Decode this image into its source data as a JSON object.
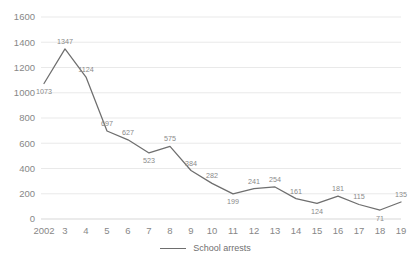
{
  "chart_data": {
    "type": "line",
    "title": "",
    "subtitle": "",
    "xlabel": "",
    "ylabel": "",
    "categories": [
      "2002",
      "3",
      "4",
      "5",
      "6",
      "7",
      "8",
      "9",
      "10",
      "11",
      "12",
      "13",
      "14",
      "15",
      "16",
      "17",
      "18",
      "19"
    ],
    "series": [
      {
        "name": "School arrests",
        "color": "#6e6e6e",
        "values": [
          1073,
          1347,
          1124,
          697,
          627,
          523,
          575,
          384,
          282,
          199,
          241,
          254,
          161,
          124,
          181,
          115,
          71,
          135
        ]
      }
    ],
    "point_labels": [
      "1073",
      "1347",
      "1124",
      "697",
      "627",
      "523",
      "575",
      "384",
      "282",
      "199",
      "241",
      "254",
      "161",
      "124",
      "181",
      "115",
      "71",
      "135"
    ],
    "ylim": [
      0,
      1600
    ],
    "ytick_labels": [
      "0",
      "200",
      "400",
      "600",
      "800",
      "1000",
      "1200",
      "1400",
      "1600"
    ],
    "ytick_values": [
      0,
      200,
      400,
      600,
      800,
      1000,
      1200,
      1400,
      1600
    ],
    "grid": "horizontal",
    "legend_position": "bottom"
  },
  "legend": {
    "items": [
      {
        "label": "School arrests",
        "color": "#6e6e6e"
      }
    ]
  },
  "caption": {
    "text": ""
  },
  "colors": {
    "line": "#6e6e6e",
    "gridline": "#e6e6e6",
    "axis": "#d2d2d2",
    "tick_text": "#878787",
    "label_text": "#8a8a8a",
    "background": "#ffffff"
  }
}
